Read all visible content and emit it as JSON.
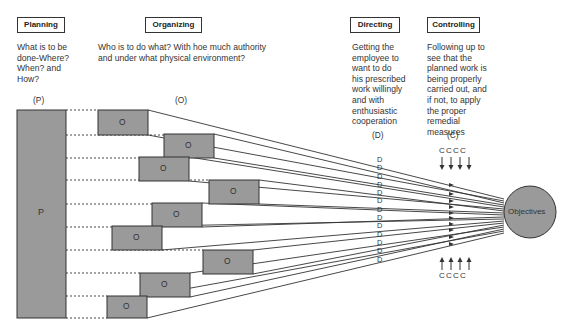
{
  "headers": {
    "planning": {
      "label": "Planning",
      "desc": [
        "What is to be",
        "done-Where?",
        "When? and",
        "How?"
      ],
      "abbr": "(P)"
    },
    "organizing": {
      "label": "Organizing",
      "desc": [
        "Who is to do what? With hoe much authority",
        "and under what  physical environment?"
      ],
      "abbr": "(O)"
    },
    "directing": {
      "label": "Directing",
      "desc": [
        "Getting the",
        "employee to",
        "want to do",
        "his prescribed",
        "work willingly",
        "and with",
        "enthusiastic",
        "cooperation"
      ],
      "abbr": "(D)"
    },
    "controlling": {
      "label": "Controlling",
      "desc": [
        "Following up to",
        "see that the",
        "planned work is",
        "being properly",
        "carried out, and",
        "if not, to apply",
        "the proper",
        "remedial",
        "measures"
      ],
      "abbr": "(C)"
    }
  },
  "diagram": {
    "planning_box_label": "P",
    "organizing_box_label": "O",
    "directing_marker": "D",
    "controlling_marker": "C",
    "controls_top": "C C C C",
    "controls_bottom": "C C C C",
    "objective_label": "Objectives",
    "colors": {
      "box_fill": "#9a9a9a",
      "stroke": "#333333",
      "circle_fill": "#9a9a9a"
    }
  }
}
